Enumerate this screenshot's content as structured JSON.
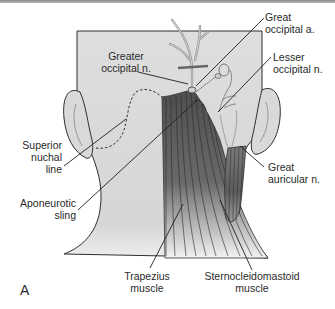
{
  "figure": {
    "panel_letter": "A",
    "colors": {
      "skin": "#dcdcdc",
      "outline": "#2f2f2f",
      "trapezius_dark": "#5a5a5a",
      "scm_dark": "#6a6a6a",
      "vessel": "#bdbdbd",
      "vessel_outline": "#777777",
      "label_text": "#2a2a2a"
    }
  },
  "labels": {
    "great_occipital_artery": [
      "Great",
      "occipital a."
    ],
    "lesser_occipital_nerve": [
      "Lesser",
      "occipital n."
    ],
    "greater_occipital_nerve": [
      "Greater",
      "occipital n."
    ],
    "superior_nuchal_line": [
      "Superior",
      "nuchal",
      "line"
    ],
    "great_auricular_nerve": [
      "Great",
      "auricular n."
    ],
    "aponeurotic_sling": [
      "Aponeurotic",
      "sling"
    ],
    "trapezius_muscle": [
      "Trapezius",
      "muscle"
    ],
    "sternocleidomastoid_muscle": [
      "Sternocleidomastoid",
      "muscle"
    ]
  }
}
